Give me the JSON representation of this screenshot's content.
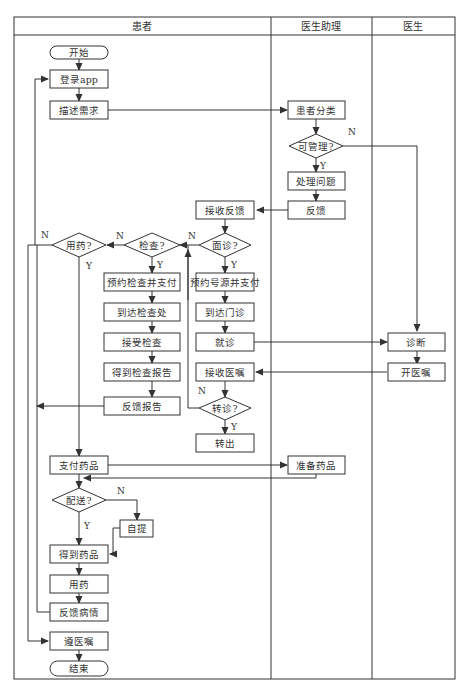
{
  "lanes": {
    "patient": "患者",
    "assistant": "医生助理",
    "doctor": "医生"
  },
  "nodes": {
    "start": "开始",
    "login": "登录app",
    "describe": "描述需求",
    "classify": "患者分类",
    "manageable": "可管理?",
    "handle": "处理问题",
    "feedback": "反馈",
    "receive_feedback": "接收反馈",
    "consult": "面诊?",
    "exam": "检查?",
    "medicate_q": "用药?",
    "book_exam": "预约检查并支付",
    "book_source": "预约号源并支付",
    "arrive_exam": "到达检查处",
    "arrive_clinic": "到达门诊",
    "undergo_exam": "接受检查",
    "visit": "就诊",
    "diagnose": "诊断",
    "get_report": "得到检查报告",
    "receive_order": "接收医嘱",
    "prescribe": "开医嘱",
    "report_feedback": "反馈报告",
    "transfer_q": "转诊?",
    "transfer_out": "转出",
    "pay_drugs": "支付药品",
    "prepare_drugs": "准备药品",
    "delivery_q": "配送?",
    "self_pickup": "自提",
    "get_drugs": "得到药品",
    "use_drugs": "用药",
    "feedback_condition": "反馈病情",
    "follow_orders": "遵医嘱",
    "end": "结束"
  },
  "branch_labels": {
    "yes": "Y",
    "no": "N"
  },
  "colors": {
    "stroke": "#333333",
    "background": "#ffffff"
  }
}
